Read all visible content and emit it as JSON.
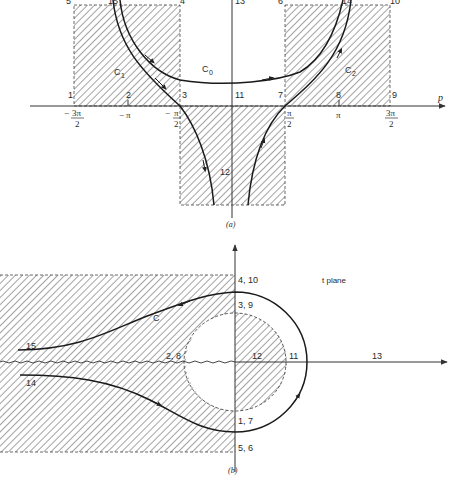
{
  "figure_a": {
    "caption": "(a)",
    "axis_label": "p",
    "tick_labels": [
      {
        "num": "3π",
        "den": "2",
        "sign": "−",
        "x": 74
      },
      {
        "num": "π",
        "den": "",
        "sign": "−",
        "x": 128
      },
      {
        "num": "π",
        "den": "2",
        "sign": "−",
        "x": 180
      },
      {
        "num": "π",
        "den": "2",
        "sign": "",
        "x": 285
      },
      {
        "num": "π",
        "den": "",
        "sign": "",
        "x": 339
      },
      {
        "num": "3π",
        "den": "2",
        "sign": "",
        "x": 390
      }
    ],
    "point_labels": {
      "p1": "1",
      "p2": "2",
      "p3": "3",
      "p4": "4",
      "p5": "5",
      "p6": "6",
      "p7": "7",
      "p8": "8",
      "p9": "9",
      "p10": "10",
      "p11": "11",
      "p12": "12",
      "p13": "13",
      "p14": "14",
      "p15": "15"
    },
    "contour_labels": {
      "c0": "C",
      "c0_sub": "0",
      "c1": "C",
      "c1_sub": "1",
      "c2": "C",
      "c2_sub": "2"
    }
  },
  "figure_b": {
    "caption": "(b)",
    "plane_label": "t plane",
    "contour_label": "C",
    "point_labels": {
      "p4_10": "4, 10",
      "p3_9": "3, 9",
      "p2_8": "2, 8",
      "p12": "12",
      "p11": "11",
      "p13": "13",
      "p1_7": "1, 7",
      "p5_6": "5, 6",
      "p15": "15",
      "p14": "14"
    }
  },
  "colors": {
    "ink": "#2a2a2a",
    "hatch": "#555555",
    "background": "#ffffff"
  }
}
